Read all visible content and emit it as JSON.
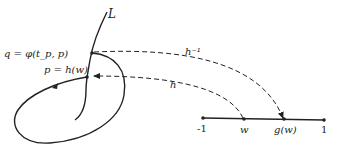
{
  "diagram": {
    "curve_label": "L",
    "point_q_label": "q = φ(t_p, p)",
    "point_p_label": "p = h(w)",
    "arrow_inverse_label": "h⁻¹",
    "arrow_label": "h",
    "segment": {
      "left_end": "-1",
      "point_w": "w",
      "point_gw": "g(w)",
      "right_end": "1"
    }
  }
}
